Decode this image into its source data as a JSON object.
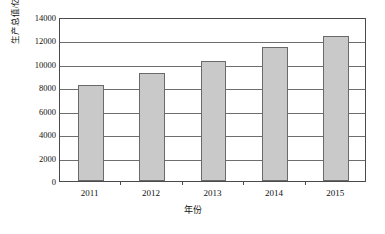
{
  "chart_data": {
    "type": "bar",
    "title": "",
    "xlabel": "年份",
    "ylabel": "生产总值/亿元",
    "categories": [
      "2011",
      "2012",
      "2013",
      "2014",
      "2015"
    ],
    "values": [
      8200,
      9200,
      10250,
      11400,
      12400
    ],
    "ylim": [
      0,
      14000
    ],
    "ytick_values": [
      0,
      2000,
      4000,
      6000,
      8000,
      10000,
      12000,
      14000
    ],
    "ytick_labels": [
      "0",
      "2000",
      "4000",
      "6000",
      "8000",
      "10000",
      "12000",
      "14000"
    ],
    "grid": true,
    "legend": null,
    "legend_position": "none",
    "bar_fill_color": "#c9c9c9",
    "bar_border_color": "#6a6a6a",
    "gridline_color": "#6e6e6e",
    "frame_color": "#4a4a4a",
    "background_color": "#ffffff"
  }
}
